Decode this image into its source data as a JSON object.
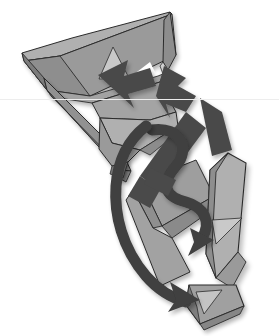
{
  "figure": {
    "alt_text": "Gray polygonal origami-like folded band shapes arranged diagonally with dark straight arrows and curved ribbon arrows weaving through them",
    "background_color": "#ffffff",
    "width": 279,
    "height": 336,
    "scanline_y": 99,
    "scanline_color": "#ededed"
  },
  "palette": {
    "paper_mid": "#9a9a9a",
    "paper_light": "#b4b4b4",
    "paper_highlight": "#c9c9c9",
    "paper_shade": "#8a8a8a",
    "paper_dark_face": "#7c7c7c",
    "arrow_dark": "#4a4a4a",
    "arrow_darker": "#3f3f3f",
    "outline": "#2b2b2b",
    "white": "#ffffff",
    "shadow": "#d8d8d8"
  },
  "elements": {
    "facets": [
      {
        "name": "top-left-flap",
        "shade": "paper_mid"
      },
      {
        "name": "top-band-upper",
        "shade": "paper_light"
      },
      {
        "name": "top-band-right-end",
        "shade": "paper_mid"
      },
      {
        "name": "left-edge-bevel",
        "shade": "paper_dark_face"
      },
      {
        "name": "left-diagonal-strut",
        "shade": "paper_shade"
      },
      {
        "name": "mid-triangle-fold",
        "shade": "paper_light"
      },
      {
        "name": "center-wedge",
        "shade": "paper_mid"
      },
      {
        "name": "lower-quad-plate",
        "shade": "paper_mid"
      },
      {
        "name": "right-long-panel",
        "shade": "paper_light"
      },
      {
        "name": "bottom-end-tab",
        "shade": "paper_mid"
      },
      {
        "name": "highlight-triangle-top",
        "shade": "paper_highlight"
      },
      {
        "name": "highlight-triangle-right",
        "shade": "paper_highlight"
      },
      {
        "name": "highlight-triangle-bottom",
        "shade": "paper_highlight"
      }
    ],
    "arrows": [
      {
        "name": "arrow-up-left-chevron",
        "style": "straight",
        "direction": "up-left",
        "color": "arrow_dark"
      },
      {
        "name": "arrow-up-right-chevron",
        "style": "straight",
        "direction": "up-right",
        "color": "arrow_dark"
      },
      {
        "name": "arrow-long-diagonal",
        "style": "straight",
        "direction": "up-left",
        "color": "arrow_dark"
      },
      {
        "name": "arrow-curved-s-ribbon",
        "style": "curved",
        "direction": "down-right",
        "color": "arrow_darker"
      },
      {
        "name": "arrow-curved-outer-sweep",
        "style": "curved",
        "direction": "down-right",
        "color": "arrow_darker"
      }
    ]
  }
}
